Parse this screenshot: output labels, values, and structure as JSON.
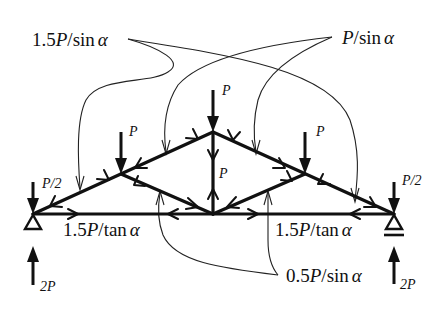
{
  "figure": {
    "type": "truss free-body diagram with member force labels",
    "labels": {
      "top_left_force": {
        "coef": "1.5",
        "var": "P",
        "rest": "/sin",
        "greek": "α"
      },
      "top_right_force": {
        "coef": "",
        "var": "P",
        "rest": "/sin",
        "greek": "α"
      },
      "bottom_left_force": {
        "coef": "1.5",
        "var": "P",
        "rest": "/tan",
        "greek": "α"
      },
      "bottom_right_force": {
        "coef": "1.5",
        "var": "P",
        "rest": "/tan",
        "greek": "α"
      },
      "bottom_center_force": {
        "coef": "0.5",
        "var": "P",
        "rest": "/sin",
        "greek": "α"
      }
    },
    "loads": {
      "left_upper_node": "P",
      "apex_node": "P",
      "right_upper_node": "P",
      "vertical_member": "P",
      "left_support_down": "P/2",
      "right_support_down": "P/2",
      "left_reaction": "2P",
      "right_reaction": "2P"
    },
    "nodes": {
      "left_support": [
        33,
        214
      ],
      "left_upper": [
        121,
        174
      ],
      "apex": [
        213,
        132
      ],
      "right_upper": [
        305,
        174
      ],
      "right_support": [
        394,
        214
      ],
      "bottom_center": [
        213,
        214
      ]
    },
    "supports": {
      "left": "pin",
      "right": "roller"
    },
    "colors": {
      "ink": "#111111",
      "background": "#ffffff"
    }
  }
}
